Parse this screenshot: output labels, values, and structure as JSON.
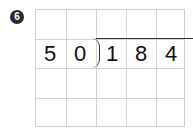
{
  "problem": {
    "number_badge": "6",
    "divisor": [
      "5",
      "0"
    ],
    "dividend": [
      "1",
      "8",
      "4"
    ],
    "grid": {
      "columns": 5,
      "rows": 4
    }
  }
}
